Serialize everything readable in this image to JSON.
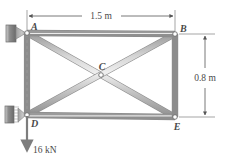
{
  "figure": {
    "type": "truss-free-body-diagram",
    "joints": [
      {
        "id": "A",
        "label": "A",
        "x": 27,
        "y": 33,
        "label_dx": 4,
        "label_dy": -3,
        "support": "pin-wall"
      },
      {
        "id": "B",
        "label": "B",
        "x": 175,
        "y": 34,
        "label_dx": 5,
        "label_dy": -2,
        "support": "none"
      },
      {
        "id": "C",
        "label": "C",
        "x": 101,
        "y": 75,
        "label_dx": 1,
        "label_dy": -5,
        "support": "none"
      },
      {
        "id": "D",
        "label": "D",
        "x": 27,
        "y": 115,
        "label_dx": 4,
        "label_dy": 12,
        "support": "pin-wall"
      },
      {
        "id": "E",
        "label": "E",
        "x": 175,
        "y": 117,
        "label_dx": 2,
        "label_dy": 13,
        "support": "none"
      }
    ],
    "members": [
      {
        "name": "AB",
        "from": "A",
        "to": "B"
      },
      {
        "name": "AD",
        "from": "A",
        "to": "D"
      },
      {
        "name": "BE",
        "from": "B",
        "to": "E"
      },
      {
        "name": "DE",
        "from": "D",
        "to": "E"
      },
      {
        "name": "AE",
        "from": "A",
        "to": "E"
      },
      {
        "name": "DB",
        "from": "D",
        "to": "B"
      }
    ],
    "dimensions": [
      {
        "name": "span-width",
        "label": "1.5 m",
        "orientation": "horizontal",
        "x1": 27,
        "x2": 175,
        "y": 16,
        "label_x": 101,
        "label_y": 14
      },
      {
        "name": "truss-height",
        "label": "0.8 m",
        "orientation": "vertical",
        "y1": 34,
        "y2": 117,
        "x": 206,
        "label_x": 214,
        "label_y": 79
      }
    ],
    "load": {
      "name": "applied-load",
      "label": "16 kN",
      "magnitude": 16,
      "unit": "kN",
      "direction": "down",
      "at_joint": "D",
      "x": 27,
      "y_start": 115,
      "y_end": 152,
      "label_x": 33,
      "label_y": 150
    },
    "guide_line": {
      "name": "vertical-centerline",
      "x": 27,
      "y1": 33,
      "y2": 118,
      "style": "dashed"
    },
    "colors": {
      "member_edge": "#8c8c8c",
      "member_fill": "#c9c9c9",
      "member_highlight": "#ececec",
      "support_wall": "#7a7a7a",
      "support_wedge": "#a8a8a8",
      "dimension": "#555555",
      "text": "#4a4a4a",
      "background": "#ffffff",
      "joint_ring": "#6e6e6e"
    }
  }
}
